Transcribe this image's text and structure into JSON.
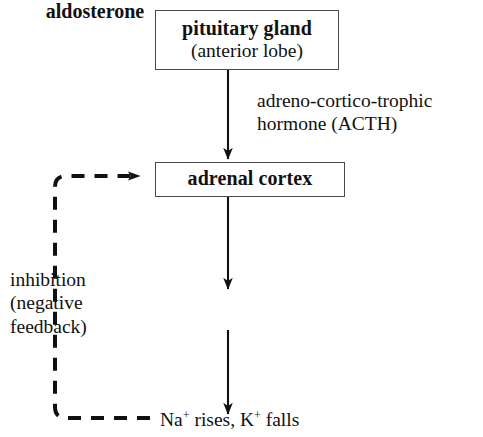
{
  "diagram": {
    "title_text": "Aldosterone regulation pathway",
    "colors": {
      "background": "#ffffff",
      "ink": "#111111",
      "box_border": "#4a4a4a",
      "arrow": "#111111",
      "dashed_feedback": "#111111"
    },
    "nodes": {
      "pituitary": {
        "title": "pituitary gland",
        "subtitle": "(anterior lobe)"
      },
      "adrenal_cortex": {
        "title": "adrenal cortex"
      },
      "aldosterone": {
        "title": "aldosterone"
      }
    },
    "labels": {
      "acth_line1": "adreno-cortico-trophic",
      "acth_line2": "hormone (ACTH)",
      "inhibition_line1": "inhibition",
      "inhibition_line2": "(negative",
      "inhibition_line3": "feedback)",
      "ions_prefix": "Na",
      "ions_sup1": "+",
      "ions_mid": " rises, K",
      "ions_sup2": "+",
      "ions_suffix": " falls"
    },
    "edges": [
      {
        "name": "pituitary-to-adrenal",
        "from": "pituitary gland (anterior lobe)",
        "to": "adrenal cortex",
        "style": "solid-arrow",
        "label": "adreno-cortico-trophic hormone (ACTH)"
      },
      {
        "name": "adrenal-to-aldosterone",
        "from": "adrenal cortex",
        "to": "aldosterone",
        "style": "solid-arrow",
        "label": ""
      },
      {
        "name": "aldosterone-to-ions",
        "from": "aldosterone",
        "to": "Na+ rises, K+ falls",
        "style": "solid-arrow",
        "label": ""
      },
      {
        "name": "ions-to-adrenal-feedback",
        "from": "Na+ rises, K+ falls",
        "to": "adrenal cortex",
        "style": "dashed-arrow",
        "label": "inhibition (negative feedback)"
      }
    ]
  }
}
